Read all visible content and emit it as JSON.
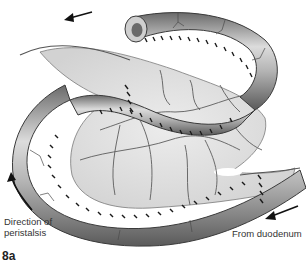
{
  "figure": {
    "label": "8a",
    "style": "grayscale medical illustration",
    "colors": {
      "background": "#ffffff",
      "bowel_light": "#e2e2e2",
      "bowel_mid": "#a8a8a8",
      "bowel_dark": "#5a5a5a",
      "mesentery": "#e6e6e6",
      "vessel": "#5c5c5c",
      "suture": "#1a1a1a",
      "text": "#333333"
    }
  },
  "annotations": {
    "direction_line1": "Direction of",
    "direction_line2": "peristalsis",
    "from_duodenum": "From duodenum"
  },
  "icons": {
    "top_arrow": "arrow-left-icon",
    "left_arrow": "arrow-up-curved-icon",
    "bottom_arrow": "arrow-down-left-icon"
  }
}
